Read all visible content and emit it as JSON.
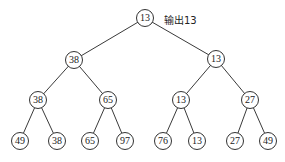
{
  "diagram": {
    "type": "binary-tree",
    "annotation": {
      "text": "输出13",
      "x": 164,
      "y": 12
    },
    "nodes": [
      {
        "id": "n0",
        "value": "13",
        "x": 145,
        "y": 18
      },
      {
        "id": "n1",
        "value": "38",
        "x": 74,
        "y": 60
      },
      {
        "id": "n2",
        "value": "13",
        "x": 216,
        "y": 59
      },
      {
        "id": "n3",
        "value": "38",
        "x": 38,
        "y": 100
      },
      {
        "id": "n4",
        "value": "65",
        "x": 108,
        "y": 100
      },
      {
        "id": "n5",
        "value": "13",
        "x": 181,
        "y": 100
      },
      {
        "id": "n6",
        "value": "27",
        "x": 250,
        "y": 100
      },
      {
        "id": "n7",
        "value": "49",
        "x": 20,
        "y": 141
      },
      {
        "id": "n8",
        "value": "38",
        "x": 57,
        "y": 141
      },
      {
        "id": "n9",
        "value": "65",
        "x": 90,
        "y": 141
      },
      {
        "id": "n10",
        "value": "97",
        "x": 125,
        "y": 141
      },
      {
        "id": "n11",
        "value": "76",
        "x": 163,
        "y": 141
      },
      {
        "id": "n12",
        "value": "13",
        "x": 197,
        "y": 141
      },
      {
        "id": "n13",
        "value": "27",
        "x": 235,
        "y": 141
      },
      {
        "id": "n14",
        "value": "49",
        "x": 268,
        "y": 141
      }
    ],
    "edges": [
      [
        "n0",
        "n1"
      ],
      [
        "n0",
        "n2"
      ],
      [
        "n1",
        "n3"
      ],
      [
        "n1",
        "n4"
      ],
      [
        "n2",
        "n5"
      ],
      [
        "n2",
        "n6"
      ],
      [
        "n3",
        "n7"
      ],
      [
        "n3",
        "n8"
      ],
      [
        "n4",
        "n9"
      ],
      [
        "n4",
        "n10"
      ],
      [
        "n5",
        "n11"
      ],
      [
        "n5",
        "n12"
      ],
      [
        "n6",
        "n13"
      ],
      [
        "n6",
        "n14"
      ]
    ]
  }
}
